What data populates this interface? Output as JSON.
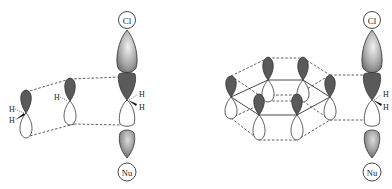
{
  "diagram": {
    "left_panel": {
      "leaving_group_label": "Cl",
      "nucleophile_label": "Nu",
      "substituent_labels": [
        "H",
        "H"
      ],
      "alkene_H_labels": [
        "H",
        "H",
        "H"
      ]
    },
    "right_panel": {
      "leaving_group_label": "Cl",
      "nucleophile_label": "Nu",
      "substituent_labels": [
        "H",
        "H"
      ]
    },
    "colors": {
      "dark_lobe": "#5a5a5a",
      "light_lobe": "#ffffff",
      "outline": "#333333",
      "gradient_light": "#eeeeee",
      "gradient_dark": "#6a6a6a"
    }
  }
}
